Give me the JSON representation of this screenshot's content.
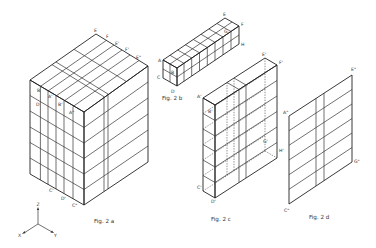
{
  "figures": {
    "fig2a": {
      "caption": "Fig. 2 a",
      "labels": {
        "E": "E",
        "F": "F",
        "E1": "E'",
        "F1": "F'",
        "E2": "E\"",
        "B": "B",
        "A1": "A'",
        "D": "D",
        "B1": "B'",
        "A2": "A\"",
        "C1": "C'",
        "D1": "D'",
        "C2": "C\""
      }
    },
    "fig2b": {
      "caption": "Fig. 2 b",
      "labels": {
        "E": "E",
        "F": "F",
        "H": "H",
        "G": "G",
        "A": "A",
        "B": "B",
        "C": "C",
        "D": "D"
      }
    },
    "fig2c": {
      "caption": "Fig. 2 c",
      "labels": {
        "E1": "E'",
        "F1": "F'",
        "A1": "A'",
        "B1": "B'",
        "G1": "G'",
        "H1": "H'",
        "C1": "C'",
        "D1": "D'"
      }
    },
    "fig2d": {
      "caption": "Fig. 2 d",
      "labels": {
        "E2": "E\"",
        "A2": "A\"",
        "G2": "G\"",
        "C2": "C\""
      }
    }
  },
  "axes": {
    "z": "Z",
    "x": "X",
    "y": "Y"
  }
}
